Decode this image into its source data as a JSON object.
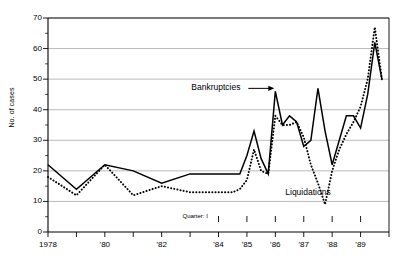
{
  "chart_data": {
    "type": "line",
    "title": "",
    "xlabel": "",
    "ylabel": "No. of cases",
    "ylim": [
      0,
      70
    ],
    "ytick_step": 10,
    "yminor_step": 5,
    "grid": "horizontal-major",
    "legend_position": "inline-annotations",
    "ytick_labels": [
      "0",
      "10",
      "20",
      "30",
      "40",
      "50",
      "60",
      "70"
    ],
    "xtick_labels": [
      "1978",
      "'79",
      "'80",
      "'81",
      "'82",
      "'83",
      "'84",
      "'85",
      "'86",
      "'87",
      "'88",
      "'89"
    ],
    "xtick_labels_shown": [
      "1978",
      "'80",
      "'82",
      "'84",
      "'85",
      "'86",
      "'87",
      "'88",
      "'89"
    ],
    "x_annual_range": [
      "1978",
      "1983"
    ],
    "x_quarterly_start": "1984 Q1",
    "quarter_marker_label": "Quarter: I",
    "series": [
      {
        "name": "Bankruptcies",
        "style": "solid",
        "color": "#000000",
        "label_text": "Bankruptcies",
        "annual_x": [
          "1978",
          "1979",
          "1980",
          "1981",
          "1982",
          "1983"
        ],
        "annual_values": [
          22,
          14,
          22,
          20,
          16,
          19
        ],
        "quarterly_x": [
          "1984 Q1",
          "1984 Q2",
          "1984 Q3",
          "1984 Q4",
          "1985 Q1",
          "1985 Q2",
          "1985 Q3",
          "1985 Q4",
          "1986 Q1",
          "1986 Q2",
          "1986 Q3",
          "1986 Q4",
          "1987 Q1",
          "1987 Q2",
          "1987 Q3",
          "1987 Q4",
          "1988 Q1",
          "1988 Q2",
          "1988 Q3",
          "1988 Q4",
          "1989 Q1",
          "1989 Q2",
          "1989 Q3",
          "1989 Q4"
        ],
        "quarterly_values": [
          19,
          19,
          19,
          19,
          25,
          33,
          24,
          19,
          46,
          35,
          38,
          36,
          28,
          30,
          47,
          33,
          22,
          30,
          38,
          38,
          34,
          45,
          62,
          50
        ]
      },
      {
        "name": "Liquidations",
        "style": "dotted",
        "color": "#000000",
        "label_text": "Liquidations",
        "annual_x": [
          "1978",
          "1979",
          "1980",
          "1981",
          "1982",
          "1983"
        ],
        "annual_values": [
          18,
          12,
          22,
          12,
          15,
          13
        ],
        "quarterly_x": [
          "1984 Q1",
          "1984 Q2",
          "1984 Q3",
          "1984 Q4",
          "1985 Q1",
          "1985 Q2",
          "1985 Q3",
          "1985 Q4",
          "1986 Q1",
          "1986 Q2",
          "1986 Q3",
          "1986 Q4",
          "1987 Q1",
          "1987 Q2",
          "1987 Q3",
          "1987 Q4",
          "1988 Q1",
          "1988 Q2",
          "1988 Q3",
          "1988 Q4",
          "1989 Q1",
          "1989 Q2",
          "1989 Q3",
          "1989 Q4"
        ],
        "quarterly_values": [
          13,
          13,
          13,
          14,
          17,
          27,
          20,
          19,
          38,
          35,
          35,
          36,
          31,
          22,
          16,
          9,
          20,
          27,
          32,
          36,
          41,
          50,
          67,
          50
        ]
      }
    ],
    "annotations": [
      {
        "text": "Bankruptcies",
        "kind": "arrow-label",
        "arrow_direction": "right"
      },
      {
        "text": "Liquidations",
        "kind": "text-label"
      },
      {
        "text": "Quarter: I",
        "kind": "axis-note"
      }
    ]
  }
}
